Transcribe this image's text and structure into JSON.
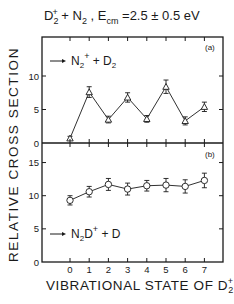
{
  "title": {
    "reactants": "D",
    "reactant_sub": "2",
    "reactant_sup": "+",
    "plus": " + N",
    "n_sub": "2",
    "energy_prefix": " ,  E",
    "energy_sub": "cm",
    "energy_value": " =2.5 ± 0.5  eV"
  },
  "ylabel": "RELATIVE  CROSS  SECTION",
  "xlabel": {
    "text": "VIBRATIONAL  STATE  OF  D",
    "sub": "2",
    "sup": "+"
  },
  "chart_data": [
    {
      "type": "line",
      "panel": "(a)",
      "title": "D2+ + N2, Ecm = 2.5 ± 0.5 eV",
      "annotation": "→ N2+ + D2",
      "marker": "triangle",
      "xlabel": "VIBRATIONAL STATE OF D2+",
      "ylabel": "RELATIVE CROSS SECTION",
      "x": [
        0,
        1,
        2,
        3,
        4,
        5,
        6,
        7
      ],
      "values": [
        0.7,
        7.6,
        3.5,
        6.8,
        3.6,
        8.4,
        3.3,
        5.4
      ],
      "errors": [
        0.3,
        0.8,
        0.5,
        0.7,
        0.5,
        1.0,
        0.6,
        0.7
      ],
      "yticks": [
        0,
        5,
        10
      ],
      "ylim": [
        0,
        15.8
      ],
      "xlim": [
        -1.5,
        8
      ]
    },
    {
      "type": "line",
      "panel": "(b)",
      "annotation": "→ N2D+ + D",
      "marker": "circle",
      "xlabel": "VIBRATIONAL STATE OF D2+",
      "ylabel": "RELATIVE CROSS SECTION",
      "x": [
        0,
        1,
        2,
        3,
        4,
        5,
        6,
        7
      ],
      "values": [
        9.3,
        10.6,
        11.7,
        11.0,
        11.5,
        11.6,
        11.4,
        12.3
      ],
      "errors": [
        0.7,
        0.8,
        0.9,
        0.9,
        0.8,
        1.0,
        1.0,
        1.1
      ],
      "yticks": [
        0,
        5,
        10,
        15
      ],
      "xticks": [
        0,
        1,
        2,
        3,
        4,
        5,
        6,
        7
      ],
      "ylim": [
        0,
        17.9
      ],
      "xlim": [
        -1.5,
        8
      ]
    }
  ],
  "panel_a": {
    "label": "(a)",
    "reaction": "N",
    "sub": "2",
    "sup": "+",
    "rest": " + D",
    "rest_sub": "2"
  },
  "panel_b": {
    "label": "(b)",
    "reaction": "N",
    "sub": "2",
    "mid": "D",
    "sup": "+",
    "rest": " + D"
  },
  "colors": {
    "ink": "#1a1a1a",
    "background": "#ffffff"
  }
}
